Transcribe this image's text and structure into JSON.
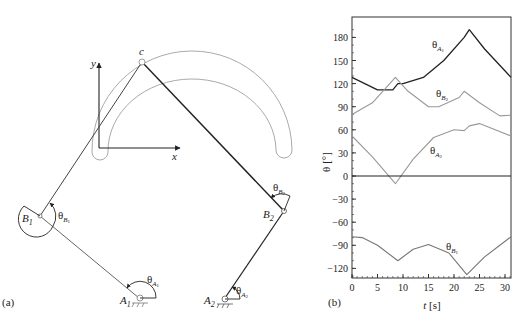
{
  "panel_a": {
    "caption": "(a)",
    "axes": {
      "x_label": "x",
      "y_label": "y"
    },
    "points": {
      "C": "c",
      "B1": {
        "base": "B",
        "sub": "1"
      },
      "B2": {
        "base": "B",
        "sub": "2"
      },
      "A1": {
        "base": "A",
        "sub": "1"
      },
      "A2": {
        "base": "A",
        "sub": "2"
      }
    },
    "angles": {
      "thetaB1": {
        "base": "θ",
        "sub": "B",
        "subsub": "1"
      },
      "thetaB2": {
        "base": "θ",
        "sub": "B",
        "subsub": "2"
      },
      "thetaA1": {
        "base": "θ",
        "sub": "A",
        "subsub": "1"
      },
      "thetaA2": {
        "base": "θ",
        "sub": "A",
        "subsub": "2"
      }
    }
  },
  "panel_b": {
    "caption": "(b)",
    "xlabel_italic": "t",
    "xlabel_unit": " [s]",
    "ylabel": "θ [°]",
    "xticks": [
      "0",
      "5",
      "10",
      "15",
      "20",
      "25",
      "30"
    ],
    "yticks": [
      "180",
      "150",
      "120",
      "90",
      "60",
      "30",
      "0",
      "−30",
      "−60",
      "−90",
      "−120"
    ],
    "series_labels": {
      "A1": {
        "base": "θ",
        "sub": "A",
        "subsub": "1"
      },
      "B2": {
        "base": "θ",
        "sub": "B",
        "subsub": "2"
      },
      "A2": {
        "base": "θ",
        "sub": "A",
        "subsub": "2"
      },
      "B1": {
        "base": "θ",
        "sub": "B",
        "subsub": "1"
      }
    }
  },
  "chart_data": {
    "type": "line",
    "title": "",
    "xlabel": "t [s]",
    "ylabel": "θ [°]",
    "xlim": [
      0,
      31.5
    ],
    "ylim": [
      -135,
      200
    ],
    "xticks": [
      0,
      5,
      10,
      15,
      20,
      25,
      30
    ],
    "yticks": [
      -120,
      -90,
      -60,
      -30,
      0,
      30,
      60,
      90,
      120,
      150,
      180
    ],
    "grid": false,
    "legend": "inline labels",
    "series": [
      {
        "name": "θA1",
        "color": "#222222",
        "x": [
          0,
          5,
          8,
          9,
          10,
          14,
          18,
          22,
          23,
          26,
          31.5
        ],
        "y": [
          128,
          112,
          112,
          120,
          120,
          128,
          150,
          180,
          190,
          165,
          128
        ]
      },
      {
        "name": "θB2",
        "color": "#999999",
        "x": [
          0,
          4,
          8.5,
          11,
          15,
          17,
          21,
          22,
          25,
          29,
          31.5
        ],
        "y": [
          80,
          95,
          128,
          110,
          90,
          90,
          102,
          110,
          95,
          78,
          79
        ]
      },
      {
        "name": "θA2",
        "color": "#999999",
        "x": [
          0,
          4,
          8.5,
          12,
          16,
          20,
          22,
          23,
          25,
          31.5
        ],
        "y": [
          52,
          25,
          -10,
          22,
          50,
          60,
          59,
          65,
          68,
          52
        ]
      },
      {
        "name": "θB1",
        "color": "#777777",
        "x": [
          0,
          2,
          5,
          9,
          12,
          15,
          19,
          22.5,
          26,
          31.5
        ],
        "y": [
          -79,
          -80,
          -90,
          -110,
          -95,
          -89,
          -100,
          -128,
          -105,
          -79
        ]
      },
      {
        "name": "zero",
        "color": "#222222",
        "x": [
          0,
          31.5
        ],
        "y": [
          0,
          0
        ]
      }
    ]
  }
}
